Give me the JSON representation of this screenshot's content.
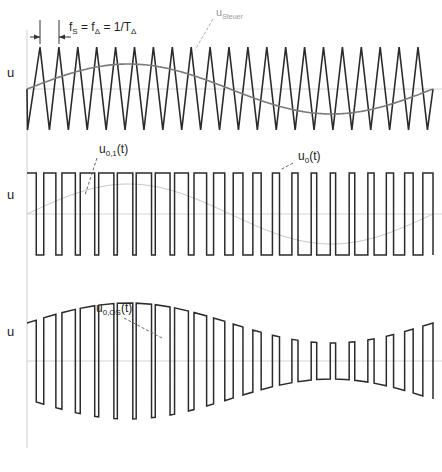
{
  "diagram": {
    "axis": {
      "x": 27,
      "top": 30,
      "bottom": 448,
      "color": "#cfcfcf"
    },
    "panel1": {
      "y_label": "u",
      "zero_y": 89,
      "tri_top": 47,
      "tri_bottom": 130,
      "tri_start_x": 27,
      "tri_first_peak_x": 40,
      "tri_period": 18.9,
      "tri_peaks": 21,
      "tri_end_x": 433,
      "sine_amp": 25,
      "sine_x0": 27,
      "sine_x1": 433,
      "freq_label": {
        "main": "f",
        "sub1": "S",
        "eq1": " = f",
        "sub2": "Δ",
        "eq2": " = 1/T",
        "sub3": "Δ"
      },
      "control_label": {
        "main": "u",
        "sub": "Steuer"
      }
    },
    "panel2": {
      "y_label": "u",
      "zero_y": 214,
      "high_y": 173,
      "low_y": 255,
      "sine_amp": 12,
      "label_u01": {
        "main": "u",
        "sub": "0,1",
        "suffix": "(t)"
      },
      "label_u0": {
        "main": "u",
        "sub": "0",
        "suffix": "(t)"
      }
    },
    "panel3": {
      "y_label": "u",
      "zero_y": 361,
      "label_u0os": {
        "main": "u",
        "sub": "0,OS",
        "suffix": "(t)"
      }
    },
    "colors": {
      "wave": "#2b2b2b",
      "control": "#7a7a7a",
      "ref_sine_faint": "#c8c8c8",
      "zero_line": "#d4d4d4",
      "leader": "#888888"
    }
  }
}
